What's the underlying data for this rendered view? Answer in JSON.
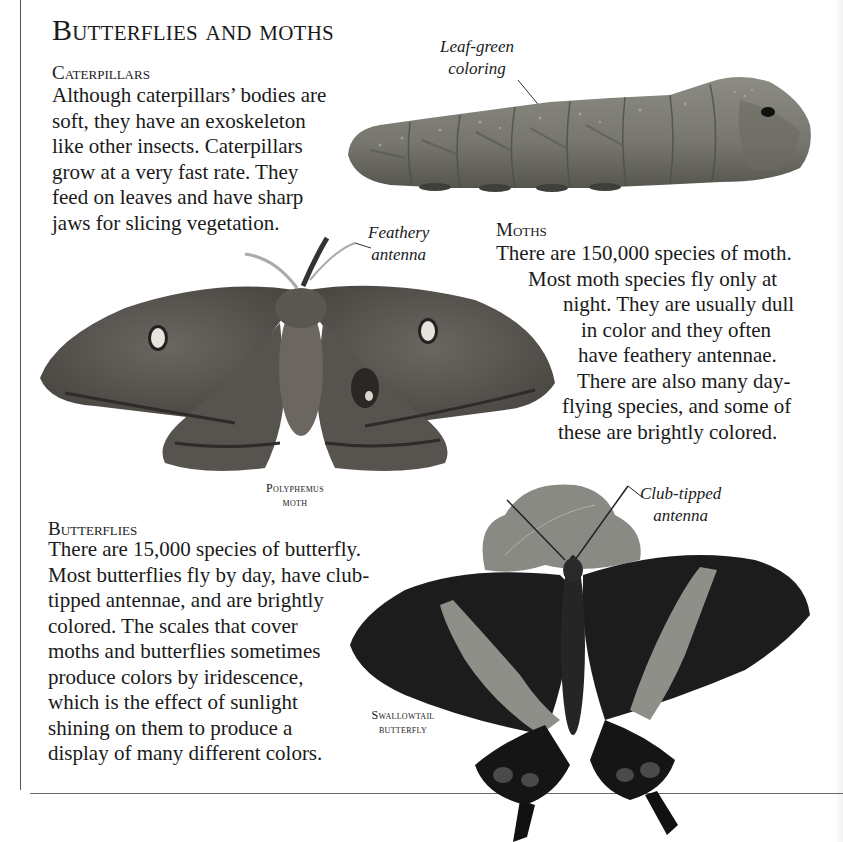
{
  "page": {
    "title": "Butterflies and moths",
    "colors": {
      "background": "#ffffff",
      "text": "#1a1a1a",
      "rule": "#666666",
      "caterpillar": "#7a7a72",
      "moth": "#5e5a56",
      "butterfly_wing": "#1c1c1c",
      "butterfly_band": "#8f8f8a",
      "leaf": "#888884"
    }
  },
  "caterpillars": {
    "heading": "Caterpillars",
    "lines": [
      "Although caterpillars’ bodies are",
      "soft, they have an exoskeleton",
      "like other insects. Caterpillars",
      "grow at a very fast rate. They",
      "feed on leaves and have sharp",
      "jaws for slicing vegetation."
    ],
    "label": {
      "lines": [
        "Leaf-green",
        "coloring"
      ]
    }
  },
  "moths": {
    "heading": "Moths",
    "lines": [
      "There are 150,000 species of moth.",
      "Most moth species fly only at",
      "night. They are usually dull",
      "in color and they often",
      "have feathery antennae.",
      "There are also many day-",
      "flying species, and some of",
      "these are brightly colored."
    ],
    "label": {
      "lines": [
        "Feathery",
        "antenna"
      ]
    },
    "caption": {
      "lines": [
        "Polyphemus",
        "moth"
      ]
    }
  },
  "butterflies": {
    "heading": "Butterflies",
    "lines": [
      "There are 15,000 species of butterfly.",
      "Most butterflies fly by day, have club-",
      "tipped antennae, and are brightly",
      "colored. The scales that cover",
      "moths and butterflies sometimes",
      "produce colors by iridescence,",
      "which is the effect of sunlight",
      "shining on them to produce a",
      "display of many different colors."
    ],
    "label": {
      "lines": [
        "Club-tipped",
        "antenna"
      ]
    },
    "caption": {
      "lines": [
        "Swallowtail",
        "butterfly"
      ]
    }
  }
}
